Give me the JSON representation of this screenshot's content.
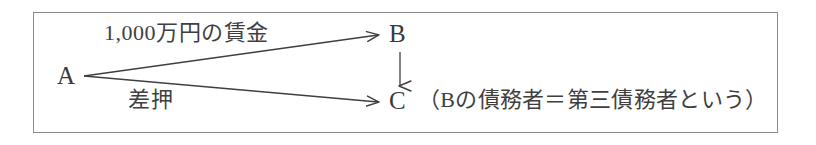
{
  "diagram": {
    "frame": {
      "border_color": "#8a8a8a",
      "background_color": "#ffffff"
    },
    "stroke_color": "#3f3f3f",
    "nodes": [
      {
        "id": "A",
        "label": "A"
      },
      {
        "id": "B",
        "label": "B"
      },
      {
        "id": "C",
        "label": "C"
      }
    ],
    "edges": [
      {
        "id": "a-to-b",
        "from": "A",
        "to": "B",
        "label": "1,000万円の賃金"
      },
      {
        "id": "a-to-c",
        "from": "A",
        "to": "C",
        "label": "差押"
      },
      {
        "id": "b-to-c",
        "from": "B",
        "to": "C",
        "label": ""
      }
    ],
    "note": "（Bの債務者＝第三債務者という）"
  }
}
